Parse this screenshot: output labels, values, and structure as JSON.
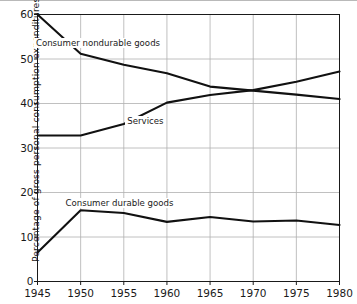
{
  "figure": {
    "top_rule_color": "#b9b9b9",
    "background": "#ffffff",
    "axis_color": "#1a1a1a",
    "grid_color": "#b0b0b0",
    "line_color": "#111111"
  },
  "axes": {
    "ylabel": "Percentage of gross personal consumption expenditures",
    "xlabel": "",
    "yticks": [
      "0",
      "10",
      "20",
      "30",
      "40",
      "50",
      "60"
    ],
    "xticks": [
      "1945",
      "1950",
      "1955",
      "1960",
      "1965",
      "1970",
      "1975",
      "1980"
    ]
  },
  "annotations": {
    "nondurable": "Consumer nondurable goods",
    "services": "Services",
    "durable": "Consumer durable goods"
  },
  "chart_data": {
    "type": "line",
    "title": "",
    "xlabel": "",
    "ylabel": "Percentage of gross personal consumption expenditures",
    "xlim": [
      1945,
      1980
    ],
    "ylim": [
      0,
      60
    ],
    "yticks": [
      0,
      10,
      20,
      30,
      40,
      50,
      60
    ],
    "xticks": [
      1945,
      1950,
      1955,
      1960,
      1965,
      1970,
      1975,
      1980
    ],
    "grid": true,
    "legend": "inline-annotations",
    "x": [
      1945,
      1950,
      1955,
      1960,
      1965,
      1970,
      1975,
      1980
    ],
    "series": [
      {
        "name": "Consumer nondurable goods",
        "values": [
          60.0,
          51.2,
          48.7,
          46.8,
          43.8,
          42.9,
          42.0,
          41.0
        ],
        "label_x": 1952.0,
        "label_y": 53.5
      },
      {
        "name": "Services",
        "values": [
          32.8,
          32.8,
          35.4,
          40.2,
          41.9,
          43.0,
          44.9,
          47.2
        ],
        "label_x": 1957.5,
        "label_y": 36.0
      },
      {
        "name": "Consumer durable goods",
        "values": [
          6.5,
          16.0,
          15.4,
          13.4,
          14.5,
          13.5,
          13.7,
          12.7
        ],
        "label_x": 1954.5,
        "label_y": 17.6
      }
    ],
    "crossing": {
      "x": 1968.6,
      "y": 43.1,
      "series": [
        "Consumer nondurable goods",
        "Services"
      ]
    }
  }
}
